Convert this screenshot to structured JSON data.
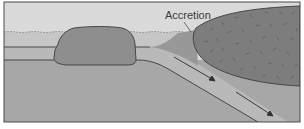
{
  "diagram": {
    "type": "geology-cross-section",
    "labels": {
      "accretion": "Accretion"
    },
    "colors": {
      "background": "#ffffff",
      "sky": "#dadada",
      "water": "#c6c6c6",
      "oceanic_crust": "#b9b9b9",
      "mantle": "#a7a7a7",
      "terrane_block": "#8e8e8e",
      "continent": "#7d7d7d",
      "accretion_wedge": "#989898",
      "slab": "#c3c3c3",
      "outline": "#3c3c3c",
      "speckle": "#5f5f5f"
    },
    "elements": [
      {
        "name": "ocean",
        "description": "water layer with wavy surface"
      },
      {
        "name": "oceanic-plate",
        "description": "horizontal oceanic lithosphere"
      },
      {
        "name": "terrane-block",
        "description": "rounded crustal block riding on the plate"
      },
      {
        "name": "accretion-wedge",
        "description": "material accreted at the plate margin"
      },
      {
        "name": "continental-plate",
        "description": "speckled continental crust on the right"
      },
      {
        "name": "subducting-slab",
        "description": "oceanic plate descending beneath the continent"
      },
      {
        "name": "motion-arrows",
        "count": 2,
        "direction": "down-right along slab"
      }
    ]
  }
}
